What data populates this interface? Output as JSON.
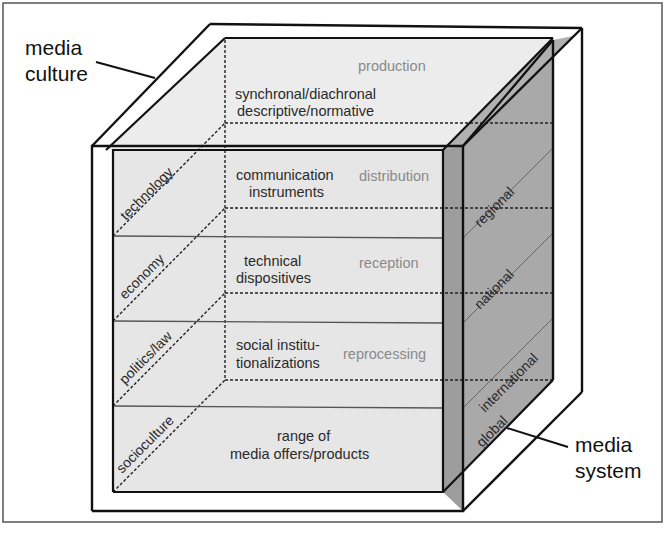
{
  "labels": {
    "media_culture": [
      "media",
      "culture"
    ],
    "media_system": [
      "media",
      "system"
    ]
  },
  "process_stages": [
    "production",
    "distribution",
    "reception",
    "reprocessing"
  ],
  "top_caption": [
    "synchronal/diachronal",
    "descriptive/normative"
  ],
  "layers": [
    {
      "content": [
        "communication",
        "instruments"
      ],
      "domain": "technology",
      "scope": "regional",
      "stage": "distribution"
    },
    {
      "content": [
        "technical",
        "dispositives"
      ],
      "domain": "economy",
      "scope": "national",
      "stage": "reception"
    },
    {
      "content": [
        "social institu-",
        "tionalizations"
      ],
      "domain": "politics/law",
      "scope": "international",
      "stage": "reprocessing"
    },
    {
      "content": [
        "range of",
        "media offers/products"
      ],
      "domain": "socioculture",
      "scope": "global",
      "stage": ""
    }
  ],
  "colors": {
    "frame": "#555555",
    "face_light": "#e6e6e6",
    "face_side": "#a6a6a6",
    "side_strip": "#9c9c9c",
    "line": "#111111",
    "grey_text": "#8a8a8a"
  }
}
